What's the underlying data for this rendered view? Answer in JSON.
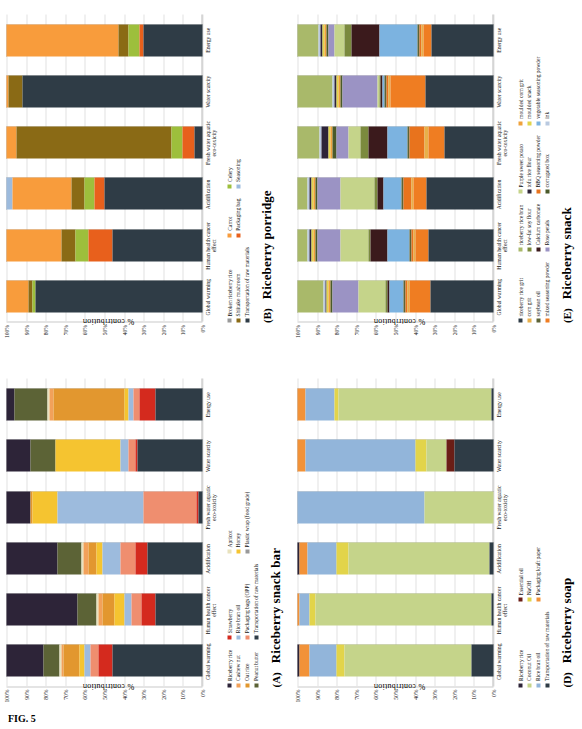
{
  "figure": {
    "caption": "FIG. 5",
    "y_axis_label": "% contribution",
    "y_ticks": [
      "100%",
      "90%",
      "80%",
      "70%",
      "60%",
      "50%",
      "40%",
      "30%",
      "20%",
      "10%",
      "0%"
    ],
    "impact_categories": [
      "Global warming",
      "Human health cancer effect",
      "Acidification",
      "Fresh water aquatic eco-toxicity",
      "Water scarcity",
      "Energy use"
    ]
  },
  "panels": [
    {
      "letter": "(A)",
      "title": "Riceberry snack bar",
      "legend_columns": [
        [
          "Riceberry rice",
          "Cashew nut",
          "Oat rice",
          "Peanut butter"
        ],
        [
          "Strawberry",
          "Rice bran oil",
          "Packaging bags (OPP)",
          "Transportation of raw materials"
        ],
        [
          "Apricot",
          "Honey",
          "Plastic wrap (food grade)"
        ]
      ]
    },
    {
      "letter": "(B)",
      "title": "Riceberry porridge",
      "legend_columns": [
        [
          "Broken riceberry rice",
          "Shiitake mushroom",
          "Transportation of raw materials"
        ],
        [
          "Carrot",
          "Packaging bag"
        ],
        [
          "Celery",
          "Seasoning"
        ]
      ]
    },
    {
      "letter": "(D)",
      "title": "Riceberry soap",
      "legend_columns": [
        [
          "Riceberry rice",
          "Coconut Oil",
          "Rice bran oil",
          "Transportation of raw materials"
        ],
        [
          "Essential oil",
          "NaOH",
          "Packaging kraft paper"
        ]
      ]
    },
    {
      "letter": "(E)",
      "title": "Riceberry snack",
      "legend_columns": [
        [
          "riceberry rice grit",
          "corn grit",
          "soybean oil",
          "mixed seasoning powder"
        ],
        [
          "riceberry rice bran",
          "low-fat soy flour",
          "Calcium carbonate",
          "Rose petals"
        ],
        [
          "Purple sweet potato",
          "tofu rice flour",
          "BBQ seasoning powder",
          "corrugated box"
        ],
        [
          "moulded corn grit",
          "moulded snack",
          "vegetable seasoning powder",
          "ink"
        ]
      ]
    }
  ],
  "chart_data": [
    {
      "type": "bar",
      "stacked": true,
      "normalized": true,
      "panel": "(A)",
      "title": "Riceberry snack bar",
      "ylabel": "% contribution",
      "xlabel": "",
      "ylim": [
        0,
        100
      ],
      "grid": true,
      "legend_position": "below",
      "categories": [
        "Global warming",
        "Human health cancer effect",
        "Acidification",
        "Fresh water aquatic eco-toxicity",
        "Water scarcity",
        "Energy use"
      ],
      "series": [
        {
          "name": "Transportation of raw materials",
          "color": "#2f3c46",
          "values": [
            46,
            24,
            28,
            2,
            33,
            24
          ]
        },
        {
          "name": "Strawberry",
          "color": "#d42a1e",
          "values": [
            7,
            7,
            6,
            1,
            1,
            8
          ]
        },
        {
          "name": "Packaging bags (OPP)",
          "color": "#ef8e6f",
          "values": [
            4,
            5,
            8,
            27,
            4,
            3
          ]
        },
        {
          "name": "Rice bran oil",
          "color": "#9dbbdd",
          "values": [
            3,
            4,
            9,
            44,
            4,
            3
          ]
        },
        {
          "name": "Honey",
          "color": "#f5c430",
          "values": [
            3,
            5,
            3,
            13,
            33,
            2
          ]
        },
        {
          "name": "Oat rice",
          "color": "#e2972f",
          "values": [
            8,
            6,
            4,
            1,
            0,
            36
          ]
        },
        {
          "name": "Cashew nut",
          "color": "#f2a15a",
          "values": [
            1,
            2,
            3,
            0,
            0,
            2
          ]
        },
        {
          "name": "Apricot",
          "color": "#e8e2bd",
          "values": [
            1,
            1,
            1,
            0,
            0,
            1
          ]
        },
        {
          "name": "Peanut butter",
          "color": "#5c6336",
          "values": [
            8,
            10,
            12,
            0,
            13,
            17
          ]
        },
        {
          "name": "Riceberry rice",
          "color": "#2d2438",
          "values": [
            19,
            36,
            26,
            12,
            12,
            4
          ]
        }
      ]
    },
    {
      "type": "bar",
      "stacked": true,
      "normalized": true,
      "panel": "(B)",
      "title": "Riceberry porridge",
      "ylabel": "% contribution",
      "xlabel": "",
      "ylim": [
        0,
        100
      ],
      "grid": true,
      "legend_position": "below",
      "categories": [
        "Global warming",
        "Human health cancer effect",
        "Acidification",
        "Fresh water aquatic eco-toxicity",
        "Water scarcity",
        "Energy use"
      ],
      "series": [
        {
          "name": "Transportation of raw materials",
          "color": "#2f3c46",
          "values": [
            85,
            46,
            50,
            4,
            92,
            30
          ]
        },
        {
          "name": "Packaging bag",
          "color": "#e8601c",
          "values": [
            0,
            12,
            5,
            6,
            0,
            2
          ]
        },
        {
          "name": "Celery",
          "color": "#9dbf3c",
          "values": [
            2,
            7,
            5,
            6,
            0,
            6
          ]
        },
        {
          "name": "Shiitake mushroom",
          "color": "#8a6a15",
          "values": [
            2,
            7,
            7,
            79,
            7,
            5
          ]
        },
        {
          "name": "Carrot",
          "color": "#f89c3c",
          "values": [
            11,
            28,
            30,
            5,
            1,
            57
          ]
        },
        {
          "name": "Seasoning",
          "color": "#9dbbdd",
          "values": [
            0,
            0,
            3,
            0,
            0,
            0
          ]
        }
      ]
    },
    {
      "type": "bar",
      "stacked": true,
      "normalized": true,
      "panel": "(D)",
      "title": "Riceberry soap",
      "ylabel": "% contribution",
      "xlabel": "",
      "ylim": [
        0,
        100
      ],
      "grid": true,
      "legend_position": "below",
      "categories": [
        "Global warming",
        "Human health cancer effect",
        "Acidification",
        "Fresh water aquatic eco-toxicity",
        "Water scarcity",
        "Energy use"
      ],
      "series": [
        {
          "name": "Transportation of raw materials",
          "color": "#2f3c46",
          "values": [
            11,
            1,
            2,
            0,
            20,
            1
          ]
        },
        {
          "name": "Essential oil",
          "color": "#6b1e16",
          "values": [
            0,
            0,
            0,
            0,
            4,
            0
          ]
        },
        {
          "name": "Coconut Oil",
          "color": "#c5d48a",
          "values": [
            65,
            90,
            72,
            35,
            10,
            78
          ]
        },
        {
          "name": "NaOH",
          "color": "#e2d44a",
          "values": [
            4,
            3,
            6,
            0,
            6,
            2
          ]
        },
        {
          "name": "Rice bran oil",
          "color": "#92b5da",
          "values": [
            14,
            5,
            15,
            65,
            56,
            15
          ]
        },
        {
          "name": "Packaging kraft paper",
          "color": "#f29238",
          "values": [
            5,
            1,
            4,
            0,
            4,
            4
          ]
        },
        {
          "name": "Riceberry rice",
          "color": "#2d2438",
          "values": [
            1,
            0,
            1,
            0,
            0,
            0
          ]
        }
      ]
    },
    {
      "type": "bar",
      "stacked": true,
      "normalized": true,
      "panel": "(E)",
      "title": "Riceberry snack",
      "ylabel": "% contribution",
      "xlabel": "",
      "ylim": [
        0,
        100
      ],
      "grid": true,
      "legend_position": "below",
      "categories": [
        "Global warming",
        "Human health cancer effect",
        "Acidification",
        "Fresh water aquatic eco-toxicity",
        "Water scarcity",
        "Energy use"
      ],
      "series": [
        {
          "name": "riceberry rice grit",
          "color": "#2f3c46",
          "values": [
            32,
            33,
            34,
            25,
            35,
            32
          ]
        },
        {
          "name": "mixed seasoning powder",
          "color": "#ef7d22",
          "values": [
            11,
            7,
            7,
            8,
            18,
            4
          ]
        },
        {
          "name": "corn grit",
          "color": "#e8b04a",
          "values": [
            1,
            1,
            1,
            2,
            1,
            1
          ]
        },
        {
          "name": "BBQ seasoning powder",
          "color": "#e8731d",
          "values": [
            1,
            1,
            4,
            8,
            1,
            1
          ]
        },
        {
          "name": "soybean oil",
          "color": "#5c6336",
          "values": [
            1,
            1,
            1,
            1,
            1,
            1
          ]
        },
        {
          "name": "vegetable seasoning powder",
          "color": "#7cb3e0",
          "values": [
            7,
            11,
            9,
            10,
            1,
            20
          ]
        },
        {
          "name": "Calcium carbonate",
          "color": "#3b1a1c",
          "values": [
            1,
            9,
            3,
            10,
            1,
            14
          ]
        },
        {
          "name": "low-fat soy flour",
          "color": "#7b8a3e",
          "values": [
            1,
            1,
            2,
            4,
            1,
            4
          ]
        },
        {
          "name": "Purple sweet potato",
          "color": "#c5d48a",
          "values": [
            14,
            14,
            17,
            6,
            1,
            5
          ]
        },
        {
          "name": "Rose petals",
          "color": "#9b93c4",
          "values": [
            13,
            12,
            12,
            6,
            18,
            3
          ]
        },
        {
          "name": "corrugated box",
          "color": "#4a5a2a",
          "values": [
            1,
            1,
            1,
            2,
            1,
            1
          ]
        },
        {
          "name": "moulded corn grit",
          "color": "#efa23c",
          "values": [
            1,
            1,
            1,
            1,
            1,
            1
          ]
        },
        {
          "name": "moulded snack",
          "color": "#e2d44a",
          "values": [
            1,
            1,
            1,
            1,
            1,
            1
          ]
        },
        {
          "name": "tofu rice flour",
          "color": "#2d2438",
          "values": [
            1,
            1,
            1,
            4,
            1,
            1
          ]
        },
        {
          "name": "ink",
          "color": "#b9c9e0",
          "values": [
            1,
            1,
            1,
            1,
            1,
            1
          ]
        },
        {
          "name": "riceberry rice bran",
          "color": "#a9b96a",
          "values": [
            13,
            5,
            5,
            11,
            18,
            11
          ]
        }
      ]
    }
  ]
}
